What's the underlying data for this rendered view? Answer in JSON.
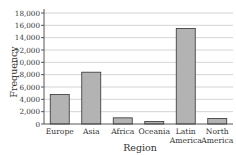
{
  "chart_data": {
    "type": "bar",
    "title": "",
    "xlabel": "Region",
    "ylabel": "Frequency",
    "categories": [
      "Europe",
      "Asia",
      "Africa",
      "Oceania",
      "Latin America",
      "North America"
    ],
    "category_label_lines": [
      [
        "Europe"
      ],
      [
        "Asia"
      ],
      [
        "Africa"
      ],
      [
        "Oceania"
      ],
      [
        "Latin",
        "America"
      ],
      [
        "North",
        "America"
      ]
    ],
    "values": [
      4800,
      8400,
      1000,
      400,
      15500,
      900
    ],
    "ylim": [
      0,
      18000
    ],
    "yticks": [
      0,
      2000,
      4000,
      6000,
      8000,
      10000,
      12000,
      14000,
      16000,
      18000
    ],
    "ytick_labels": [
      "0",
      "2,000",
      "4,000",
      "6,000",
      "8,000",
      "10,000",
      "12,000",
      "14,000",
      "16,000",
      "18,000"
    ],
    "grid": true,
    "legend": null,
    "bar_color": "#b3b3b3",
    "bar_edge_color": "#333333"
  }
}
